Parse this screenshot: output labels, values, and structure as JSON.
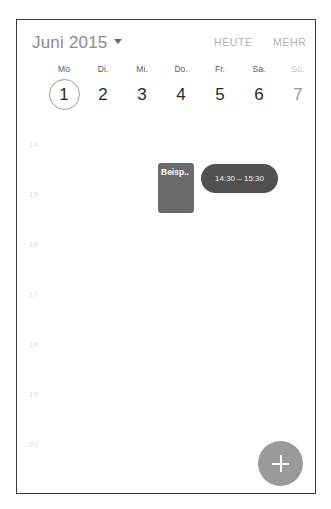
{
  "header": {
    "month_label": "Juni 2015",
    "today_button": "HEUTE",
    "more_button": "MEHR"
  },
  "week": {
    "days": [
      {
        "name": "Mo",
        "number": "1",
        "today": true
      },
      {
        "name": "Di.",
        "number": "2"
      },
      {
        "name": "Mi.",
        "number": "3"
      },
      {
        "name": "Do.",
        "number": "4"
      },
      {
        "name": "Fr.",
        "number": "5"
      },
      {
        "name": "Sa.",
        "number": "6"
      },
      {
        "name": "So.",
        "number": "7",
        "sunday": true
      }
    ]
  },
  "hours": [
    "14",
    "15",
    "16",
    "17",
    "18",
    "19",
    "20"
  ],
  "events": [
    {
      "title": "Beisp..",
      "color": "#6a6a6a"
    },
    {
      "time_range": "14:30 – 15:30",
      "color": "#505050"
    }
  ],
  "fab": {
    "icon": "plus-icon"
  }
}
